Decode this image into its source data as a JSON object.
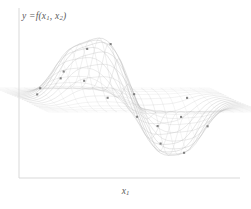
{
  "figure": {
    "name": "surface-wireframe-plot",
    "background_color": "#ffffff",
    "axis_color": "#d9d9d9",
    "mesh_color": "#b9b9b9",
    "marker_color": "#6e6e6e",
    "label_color": "#5a5a5a"
  },
  "labels": {
    "y_axis_prefix": "y",
    "y_axis_equals": "=",
    "y_axis_function": "f(",
    "y_axis_var1": "x",
    "y_axis_var1_sub": "1",
    "y_axis_comma": ", ",
    "y_axis_var2": "x",
    "y_axis_var2_sub": "2",
    "y_axis_close": ")",
    "y_axis_full": "y = f(x1, x2)",
    "x_axis_var": "x",
    "x_axis_sub": "1",
    "x_axis_full": "x1"
  },
  "chart_data": {
    "type": "line",
    "title": "",
    "xlabel": "x1",
    "ylabel": "y = f(x1, x2)",
    "render_style": "3d-wireframe-surface-projection",
    "grid": false,
    "legend": null,
    "axis_frame": {
      "y_axis_x": 19,
      "y_axis_top": 8,
      "y_axis_bottom": 178,
      "x_axis_y": 178,
      "x_axis_left": 19,
      "x_axis_right": 240
    },
    "x": [
      -4.0,
      -3.6,
      -3.2,
      -2.8,
      -2.4,
      -2.0,
      -1.6,
      -1.2,
      -0.8,
      -0.4,
      0.0,
      0.4,
      0.8,
      1.2,
      1.6,
      2.0,
      2.4,
      2.8,
      3.2,
      3.6,
      4.0
    ],
    "xlim": [
      -4.0,
      4.0
    ],
    "ylim": [
      -1.1,
      1.1
    ],
    "surface_description": "Two-variable smooth function with a tall central peak, a deep central trough below it, and symmetric secondary lobes on both the left and right; mesh lines converge to sharp tails at the far left and far right edges.",
    "n_mesh_lines_u": 21,
    "n_mesh_lines_v": 21,
    "marker_count": 58,
    "series": [
      {
        "name": "v=-1.0",
        "amplitude": 0.06,
        "values": [
          0.0,
          0.01,
          0.01,
          0.02,
          0.03,
          0.04,
          0.04,
          0.03,
          0.02,
          0.01,
          0.0,
          -0.01,
          -0.02,
          -0.03,
          -0.04,
          -0.04,
          -0.03,
          -0.02,
          -0.01,
          -0.01,
          0.0
        ]
      },
      {
        "name": "v=-0.8",
        "amplitude": 0.22,
        "values": [
          0.0,
          0.02,
          0.05,
          0.1,
          0.16,
          0.2,
          0.18,
          0.12,
          0.05,
          0.01,
          0.0,
          -0.03,
          -0.09,
          -0.16,
          -0.2,
          -0.19,
          -0.14,
          -0.08,
          -0.03,
          -0.01,
          0.0
        ]
      },
      {
        "name": "v=-0.6",
        "amplitude": 0.4,
        "values": [
          0.0,
          0.03,
          0.09,
          0.19,
          0.3,
          0.37,
          0.33,
          0.22,
          0.1,
          0.02,
          0.0,
          -0.06,
          -0.17,
          -0.29,
          -0.37,
          -0.35,
          -0.26,
          -0.14,
          -0.05,
          -0.01,
          0.0
        ]
      },
      {
        "name": "v=-0.4",
        "amplitude": 0.58,
        "values": [
          0.0,
          0.04,
          0.13,
          0.27,
          0.43,
          0.54,
          0.48,
          0.32,
          0.14,
          0.03,
          0.0,
          -0.09,
          -0.24,
          -0.42,
          -0.53,
          -0.5,
          -0.37,
          -0.2,
          -0.07,
          -0.02,
          0.0
        ]
      },
      {
        "name": "v=-0.2",
        "amplitude": 0.76,
        "values": [
          0.0,
          0.05,
          0.17,
          0.35,
          0.56,
          0.71,
          0.63,
          0.42,
          0.19,
          0.04,
          0.0,
          -0.12,
          -0.32,
          -0.55,
          -0.7,
          -0.66,
          -0.48,
          -0.26,
          -0.09,
          -0.02,
          0.0
        ]
      },
      {
        "name": "v=0.0",
        "amplitude": 0.92,
        "values": [
          0.0,
          0.06,
          0.2,
          0.42,
          0.68,
          0.86,
          0.77,
          0.51,
          0.23,
          0.05,
          0.0,
          -0.14,
          -0.38,
          -0.66,
          -0.85,
          -0.8,
          -0.58,
          -0.31,
          -0.11,
          -0.03,
          0.0
        ]
      },
      {
        "name": "v=0.2",
        "amplitude": 1.0,
        "values": [
          0.0,
          0.07,
          0.22,
          0.46,
          0.74,
          0.94,
          0.84,
          0.56,
          0.25,
          0.06,
          0.0,
          -0.15,
          -0.41,
          -0.72,
          -0.92,
          -0.87,
          -0.63,
          -0.34,
          -0.12,
          -0.03,
          0.0
        ]
      },
      {
        "name": "v=0.4",
        "amplitude": 0.88,
        "values": [
          0.0,
          0.06,
          0.19,
          0.4,
          0.65,
          0.82,
          0.74,
          0.49,
          0.22,
          0.05,
          0.0,
          -0.13,
          -0.36,
          -0.63,
          -0.81,
          -0.76,
          -0.55,
          -0.3,
          -0.1,
          -0.02,
          0.0
        ]
      },
      {
        "name": "v=0.6",
        "amplitude": 0.62,
        "values": [
          0.0,
          0.04,
          0.14,
          0.29,
          0.46,
          0.58,
          0.52,
          0.34,
          0.15,
          0.03,
          0.0,
          -0.09,
          -0.26,
          -0.45,
          -0.57,
          -0.54,
          -0.39,
          -0.21,
          -0.07,
          -0.02,
          0.0
        ]
      },
      {
        "name": "v=0.8",
        "amplitude": 0.34,
        "values": [
          0.0,
          0.02,
          0.08,
          0.16,
          0.25,
          0.32,
          0.28,
          0.19,
          0.08,
          0.02,
          0.0,
          -0.05,
          -0.14,
          -0.25,
          -0.31,
          -0.3,
          -0.22,
          -0.12,
          -0.04,
          -0.01,
          0.0
        ]
      },
      {
        "name": "v=1.0",
        "amplitude": 0.1,
        "values": [
          0.0,
          0.01,
          0.02,
          0.05,
          0.07,
          0.09,
          0.08,
          0.05,
          0.02,
          0.01,
          0.0,
          -0.01,
          -0.04,
          -0.07,
          -0.09,
          -0.09,
          -0.06,
          -0.03,
          -0.01,
          0.0,
          0.0
        ]
      }
    ]
  }
}
